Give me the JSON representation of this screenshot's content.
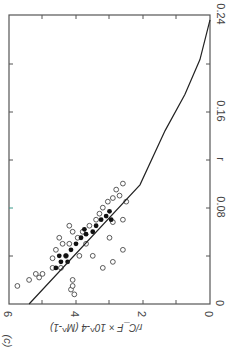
{
  "panel_label": "(c)",
  "chart_data": {
    "type": "scatter",
    "orientation_note": "figure rotated 90 degrees clockwise in image",
    "title": "",
    "xlabel": "r",
    "ylabel": "r/C_F × 10^-4 (M^-1)",
    "xlim": [
      0,
      0.24
    ],
    "ylim": [
      0,
      6
    ],
    "x_ticks": [
      "0",
      "0.08",
      "0.16",
      "0.24"
    ],
    "y_ticks": [
      "0",
      "2",
      "4",
      "6"
    ],
    "grid": false,
    "series": [
      {
        "name": "open circles",
        "marker": "open-circle",
        "points": [
          [
            0.015,
            5.75
          ],
          [
            0.02,
            5.4
          ],
          [
            0.022,
            5.1
          ],
          [
            0.025,
            5.2
          ],
          [
            0.025,
            5.0
          ],
          [
            0.03,
            4.7
          ],
          [
            0.038,
            4.7
          ],
          [
            0.03,
            4.45
          ],
          [
            0.012,
            4.15
          ],
          [
            0.015,
            4.1
          ],
          [
            0.02,
            4.1
          ],
          [
            0.008,
            4.05
          ],
          [
            0.045,
            4.6
          ],
          [
            0.05,
            4.4
          ],
          [
            0.05,
            4.2
          ],
          [
            0.055,
            4.5
          ],
          [
            0.055,
            3.95
          ],
          [
            0.06,
            4.1
          ],
          [
            0.06,
            3.8
          ],
          [
            0.065,
            4.2
          ],
          [
            0.04,
            3.9
          ],
          [
            0.04,
            3.5
          ],
          [
            0.03,
            3.2
          ],
          [
            0.065,
            3.6
          ],
          [
            0.07,
            3.4
          ],
          [
            0.075,
            3.3
          ],
          [
            0.08,
            3.2
          ],
          [
            0.085,
            3.05
          ],
          [
            0.088,
            2.9
          ],
          [
            0.09,
            2.7
          ],
          [
            0.095,
            2.8
          ],
          [
            0.1,
            2.6
          ],
          [
            0.068,
            2.9
          ],
          [
            0.035,
            2.9
          ],
          [
            0.045,
            2.6
          ],
          [
            0.055,
            3.0
          ],
          [
            0.07,
            2.6
          ],
          [
            0.085,
            2.5
          ],
          [
            0.04,
            4.3
          ],
          [
            0.05,
            3.7
          ]
        ]
      },
      {
        "name": "filled circles",
        "marker": "filled-circle",
        "points": [
          [
            0.03,
            4.6
          ],
          [
            0.035,
            4.45
          ],
          [
            0.04,
            4.3
          ],
          [
            0.045,
            4.15
          ],
          [
            0.05,
            4.0
          ],
          [
            0.055,
            3.85
          ],
          [
            0.058,
            3.7
          ],
          [
            0.06,
            3.5
          ],
          [
            0.065,
            3.4
          ],
          [
            0.07,
            3.25
          ],
          [
            0.073,
            3.1
          ],
          [
            0.077,
            3.0
          ],
          [
            0.062,
            3.75
          ],
          [
            0.07,
            2.95
          ],
          [
            0.04,
            4.5
          ],
          [
            0.035,
            4.25
          ]
        ]
      },
      {
        "name": "fitted curve",
        "marker": "line",
        "points": [
          [
            0,
            5.4
          ],
          [
            0.099,
            2.09
          ],
          [
            0.144,
            1.34
          ],
          [
            0.174,
            0.75
          ],
          [
            0.203,
            0.3
          ],
          [
            0.236,
            0.0
          ]
        ]
      }
    ]
  }
}
